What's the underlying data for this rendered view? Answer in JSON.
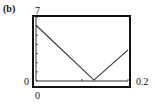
{
  "panel_label": "(b)",
  "chart_data": {
    "type": "line",
    "title": "",
    "xlabel": "",
    "ylabel": "",
    "xlim": [
      0,
      0.2
    ],
    "ylim": [
      0,
      7
    ],
    "x_tick_labels": {
      "min": "0",
      "max": "0.2"
    },
    "y_tick_labels": {
      "min": "0",
      "max": "7"
    },
    "grid": false,
    "legend": null,
    "series": [
      {
        "name": "f(x)",
        "x": [
          0,
          0.126,
          0.2
        ],
        "y": [
          6.1,
          0.1,
          3.4
        ]
      }
    ],
    "line_color": "#333333"
  }
}
